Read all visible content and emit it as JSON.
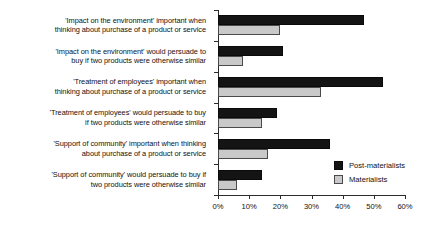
{
  "chart_data": {
    "type": "bar",
    "orientation": "horizontal",
    "title": "",
    "xlabel": "",
    "ylabel": "",
    "xlim": [
      0,
      60
    ],
    "grid": false,
    "legend_position": "inside-bottom-right",
    "xticks": [
      "0%",
      "10%",
      "20%",
      "30%",
      "40%",
      "50%",
      "60%"
    ],
    "xtick_values": [
      0,
      10,
      20,
      30,
      40,
      50,
      60
    ],
    "categories": [
      "'Impact on the environment' important when thinking about purchase of a product or service",
      "'Impact on the environment' would persuade to buy if two products were otherwise similar",
      "'Treatment of employees' important when thinking about purchase of a product or service",
      "'Treatment of employees' would persuade to buy if two products were otherwise similar",
      "'Support of community' important when thinking about purchase of a product or service",
      "'Support of community' would persuade to buy if two products were otherwise similar"
    ],
    "category_lines": [
      [
        "'Impact on the environment' important when",
        "thinking about purchase of a product or service"
      ],
      [
        "'Impact on the environment' would persuade to",
        "buy if two products were otherwise similar"
      ],
      [
        "'Treatment of employees' important when",
        "thinking about purchase of a product or service"
      ],
      [
        "'Treatment of employees' would persuade to buy",
        "if two products were otherwise similar"
      ],
      [
        "'Support of community' important when thinking",
        "about purchase of a product or service"
      ],
      [
        "'Support of community' would persuade to buy if",
        "two products were otherwise similar"
      ]
    ],
    "series": [
      {
        "name": "Post-materialists",
        "color": "#141414",
        "values": [
          47,
          21,
          53,
          19,
          36,
          14
        ]
      },
      {
        "name": "Materialists",
        "color": "#c9c9c9",
        "values": [
          20,
          8,
          33,
          14,
          16,
          6
        ]
      }
    ]
  },
  "legend": {
    "items": [
      {
        "label": "Post-materialists",
        "swatch": "post"
      },
      {
        "label": "Materialists",
        "swatch": "mat"
      }
    ]
  }
}
